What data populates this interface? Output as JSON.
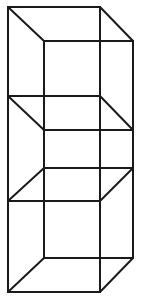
{
  "diagram": {
    "type": "wireframe-cube-tower",
    "stroke_color": "#1a1a1a",
    "background_color": "#ffffff",
    "vertices": {
      "top_back_left": [
        8,
        7
      ],
      "top_back_right": [
        100,
        7
      ],
      "top_front_left": [
        44,
        41
      ],
      "top_front_right": [
        133,
        41
      ],
      "mid1_back_left": [
        8,
        96
      ],
      "mid1_back_right": [
        100,
        96
      ],
      "mid1_front_left": [
        44,
        130
      ],
      "mid1_front_right": [
        133,
        130
      ],
      "mid2_front_left": [
        44,
        168
      ],
      "mid2_front_right": [
        133,
        168
      ],
      "mid2_back_left": [
        8,
        201
      ],
      "mid2_back_right": [
        100,
        201
      ],
      "bottom_front_left": [
        44,
        258
      ],
      "bottom_front_right": [
        133,
        258
      ],
      "bottom_back_left": [
        8,
        292
      ],
      "bottom_back_right": [
        100,
        292
      ]
    },
    "edges": [
      {
        "from": "top_back_left",
        "to": "top_back_right"
      },
      {
        "from": "top_back_left",
        "to": "top_front_left"
      },
      {
        "from": "top_back_right",
        "to": "top_front_right"
      },
      {
        "from": "top_front_left",
        "to": "top_front_right"
      },
      {
        "from": "mid1_back_left",
        "to": "mid1_back_right"
      },
      {
        "from": "mid1_back_left",
        "to": "mid1_front_left"
      },
      {
        "from": "mid1_back_right",
        "to": "mid1_front_right"
      },
      {
        "from": "mid1_front_left",
        "to": "mid1_front_right"
      },
      {
        "from": "mid2_front_left",
        "to": "mid2_front_right"
      },
      {
        "from": "mid2_front_left",
        "to": "mid2_back_left"
      },
      {
        "from": "mid2_front_right",
        "to": "mid2_back_right"
      },
      {
        "from": "mid2_back_left",
        "to": "mid2_back_right"
      },
      {
        "from": "bottom_front_left",
        "to": "bottom_front_right"
      },
      {
        "from": "bottom_front_left",
        "to": "bottom_back_left"
      },
      {
        "from": "bottom_front_right",
        "to": "bottom_back_right"
      },
      {
        "from": "bottom_back_left",
        "to": "bottom_back_right"
      },
      {
        "from": "top_back_left",
        "to": "bottom_back_left"
      },
      {
        "from": "top_back_right",
        "to": "bottom_back_right"
      },
      {
        "from": "top_front_left",
        "to": "bottom_front_left"
      },
      {
        "from": "top_front_right",
        "to": "bottom_front_right"
      }
    ]
  }
}
